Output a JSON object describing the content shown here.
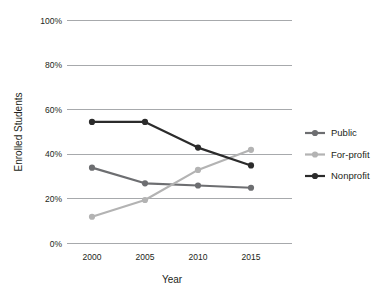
{
  "chart_data": {
    "type": "line",
    "title": "",
    "xlabel": "Year",
    "ylabel": "Enrolled Students",
    "categories": [
      "2000",
      "2005",
      "2010",
      "2015"
    ],
    "x": [
      2000,
      2005,
      2010,
      2015
    ],
    "xlim": [
      1997.5,
      2017.5
    ],
    "ylim": [
      0,
      100
    ],
    "yticks": [
      "0%",
      "20%",
      "40%",
      "60%",
      "80%",
      "100%"
    ],
    "ytick_values": [
      0,
      20,
      40,
      60,
      80,
      100
    ],
    "grid": "horizontal",
    "legend_position": "right",
    "series": [
      {
        "name": "Public",
        "color": "#6d6e71",
        "values": [
          34,
          27,
          26,
          25
        ]
      },
      {
        "name": "For-profit",
        "color": "#b3b3b3",
        "values": [
          12,
          19.5,
          33,
          42
        ]
      },
      {
        "name": "Nonprofit",
        "color": "#2b2b2b",
        "values": [
          54.5,
          54.5,
          43,
          35
        ]
      }
    ]
  },
  "axes": {
    "y_title": "Enrolled Students",
    "x_title": "Year",
    "y_tick_0": "0%",
    "y_tick_1": "20%",
    "y_tick_2": "40%",
    "y_tick_3": "60%",
    "y_tick_4": "80%",
    "y_tick_5": "100%",
    "x_tick_0": "2000",
    "x_tick_1": "2005",
    "x_tick_2": "2010",
    "x_tick_3": "2015"
  },
  "legend": {
    "items": [
      {
        "label": "Public",
        "color": "#6d6e71"
      },
      {
        "label": "For-profit",
        "color": "#b3b3b3"
      },
      {
        "label": "Nonprofit",
        "color": "#2b2b2b"
      }
    ]
  },
  "colors": {
    "gridline": "#a7a9ac",
    "text": "#231f20",
    "background": "#ffffff"
  }
}
